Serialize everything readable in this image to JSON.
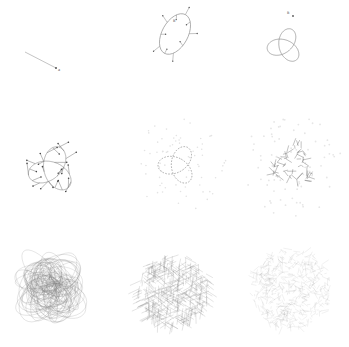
{
  "figure": {
    "title": "",
    "rows": 3,
    "cols": 3,
    "stroke_color": "#555555",
    "faint_color": "#bbbbbb",
    "background": "#ffffff"
  },
  "panels": [
    {
      "id": "p1",
      "kind": "segment",
      "label": "a",
      "description": "single short line segment with endpoint marker"
    },
    {
      "id": "p2",
      "kind": "ellipse-with-spokes",
      "spokes": 10,
      "label": "B",
      "description": "tilted ellipse with short radial spokes and tiny labels"
    },
    {
      "id": "p3",
      "kind": "trefoil",
      "label": "B",
      "description": "trefoil-like three-lobe loop with start marker"
    },
    {
      "id": "p4",
      "kind": "trefoil-with-spokes",
      "spokes": 24,
      "description": "trefoil curve with many short spoke segments ending in dots"
    },
    {
      "id": "p5",
      "kind": "trefoil-dashed-halo",
      "description": "dashed trefoil with faint surrounding dot halo"
    },
    {
      "id": "p6",
      "kind": "tangled-halo",
      "description": "dense tangled strokes with faint dot halo"
    },
    {
      "id": "p7",
      "kind": "scribble-ball",
      "description": "dense scribbled ellipse loops forming a ball"
    },
    {
      "id": "p8",
      "kind": "hairy-ball",
      "description": "dense ball of short hair-like strokes"
    },
    {
      "id": "p9",
      "kind": "fuzzy-ball",
      "description": "faint, noisy dense ball of fine strokes"
    }
  ]
}
